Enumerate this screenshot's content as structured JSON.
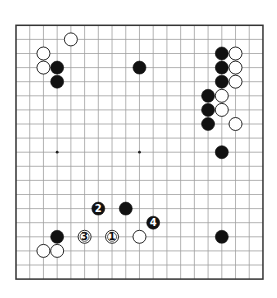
{
  "board": {
    "size": 19,
    "origin_x": 16,
    "origin_y": 25.3,
    "spacing_x": 13.72,
    "spacing_y": 14.1,
    "stone_diameter": 13,
    "line_color": "#a0a0a0",
    "border_color": "#333333",
    "star_points": [
      [
        3,
        9
      ],
      [
        9,
        9
      ]
    ],
    "black_stones": [
      [
        3,
        3
      ],
      [
        3,
        4
      ],
      [
        9,
        3
      ],
      [
        15,
        2
      ],
      [
        15,
        3
      ],
      [
        15,
        4
      ],
      [
        14,
        5
      ],
      [
        14,
        6
      ],
      [
        14,
        7
      ],
      [
        15,
        9
      ],
      [
        8,
        13
      ],
      [
        3,
        15
      ],
      [
        15,
        15
      ]
    ],
    "white_stones": [
      [
        4,
        1
      ],
      [
        2,
        2
      ],
      [
        2,
        3
      ],
      [
        16,
        2
      ],
      [
        16,
        3
      ],
      [
        16,
        4
      ],
      [
        15,
        5
      ],
      [
        15,
        6
      ],
      [
        16,
        7
      ],
      [
        9,
        15
      ],
      [
        2,
        16
      ],
      [
        3,
        16
      ]
    ],
    "numbered_moves": [
      {
        "label": "1",
        "color": "white",
        "col": 7,
        "row": 15
      },
      {
        "label": "2",
        "color": "black",
        "col": 6,
        "row": 13
      },
      {
        "label": "3",
        "color": "white",
        "col": 5,
        "row": 15
      },
      {
        "label": "4",
        "color": "black",
        "col": 10,
        "row": 14
      }
    ]
  }
}
